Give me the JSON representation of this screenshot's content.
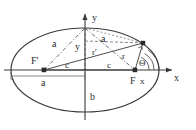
{
  "figure": {
    "background_color": "#ffffff",
    "stroke_color": "#3a3a3a",
    "accent_color": "#555555"
  },
  "axes": {
    "x_label": "x",
    "y_label": "y"
  },
  "labels": {
    "semi_major_upper_left": "a",
    "semi_major_upper_right": "a",
    "semi_minor_vertical": "b",
    "semi_major_baseline": "a",
    "focal_left": "c",
    "focal_right": "c",
    "focus_right": "F",
    "focus_left": "F'",
    "radius_right": "r",
    "radius_left": "r'",
    "ordinate": "y",
    "abscissa": "x",
    "angle": "Θ"
  },
  "geometry": {
    "center": {
      "x": 85,
      "y": 70
    },
    "semi_axis_a": 74,
    "semi_axis_b": 42,
    "focus_right_point": {
      "x": 135,
      "y": 70
    },
    "focus_left_point": {
      "x": 44,
      "y": 70
    },
    "point_on_ellipse": {
      "x": 143,
      "y": 43
    },
    "top_vertex": {
      "x": 85,
      "y": 28
    },
    "left_vertex": {
      "x": 11,
      "y": 70
    },
    "right_vertex": {
      "x": 159,
      "y": 70
    }
  }
}
